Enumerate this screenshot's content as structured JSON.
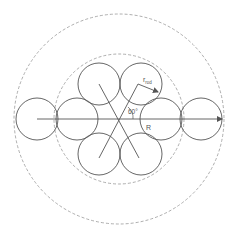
{
  "diagram": {
    "type": "geometry",
    "center": [
      119,
      119
    ],
    "outer_circle": {
      "r": 105,
      "style": "dashed",
      "color": "#999999"
    },
    "inner_circle": {
      "r": 65,
      "style": "dashed",
      "color": "#999999"
    },
    "rod_radius": 21,
    "rod_color": "#555555",
    "rods": [
      {
        "cx": 37,
        "cy": 119
      },
      {
        "cx": 77,
        "cy": 119
      },
      {
        "cx": 161,
        "cy": 119
      },
      {
        "cx": 201,
        "cy": 119
      },
      {
        "cx": 99,
        "cy": 84
      },
      {
        "cx": 141,
        "cy": 84
      },
      {
        "cx": 99,
        "cy": 154
      },
      {
        "cx": 141,
        "cy": 154
      }
    ],
    "labels": {
      "r_rod_main": "r",
      "r_rod_sub": "rod",
      "angle": "60°",
      "R": "R"
    }
  }
}
